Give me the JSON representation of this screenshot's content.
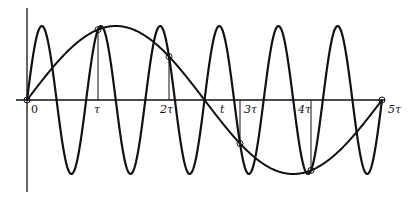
{
  "figure": {
    "axis": {
      "origin_label": "0",
      "axis_variable_label": "t",
      "tick_labels": [
        "τ",
        "2τ",
        "3τ",
        "4τ",
        "5τ"
      ]
    },
    "curves": [
      {
        "name": "fast-sinusoid",
        "cycles_over_5tau": 6,
        "amplitude": 1
      },
      {
        "name": "alias-sinusoid",
        "cycles_over_5tau": 1,
        "amplitude": 1
      }
    ],
    "sample_points": [
      "0",
      "τ",
      "2τ",
      "3τ",
      "4τ",
      "5τ"
    ],
    "colors": {
      "ink": "#111111",
      "background": "#ffffff"
    }
  }
}
